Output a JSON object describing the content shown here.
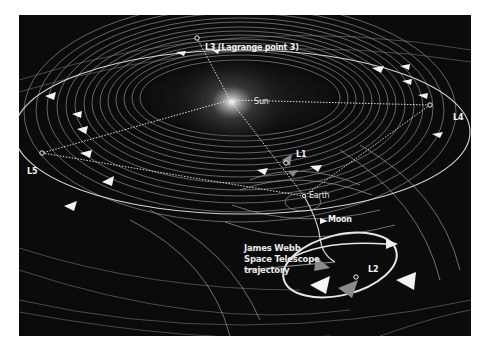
{
  "figure": {
    "background": "#0b0b0b",
    "page_background": "#ffffff",
    "line_color": "#9a9a9a",
    "highlight_color": "#e8e8e8"
  },
  "labels": {
    "sun": "Sun",
    "earth": "Earth",
    "moon": "Moon",
    "l1": "L1",
    "l2": "L2",
    "l3_short": "L3",
    "l3_note": "(Lagrange point 3)",
    "l4": "L4",
    "l5": "L5",
    "jwst_line1": "James Webb",
    "jwst_line2": "Space Telescope",
    "jwst_line3": "trajectory"
  },
  "points": {
    "sun": {
      "x": 230,
      "y": 100
    },
    "earth": {
      "x": 304,
      "y": 196
    },
    "moon": {
      "x": 307,
      "y": 197
    },
    "l1": {
      "x": 267,
      "y": 153
    },
    "l2": {
      "x": 337,
      "y": 263
    },
    "l3": {
      "x": 197,
      "y": 38
    },
    "l4": {
      "x": 430,
      "y": 105
    },
    "l5": {
      "x": 42,
      "y": 153
    }
  }
}
